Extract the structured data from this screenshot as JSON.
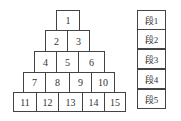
{
  "pyramid": {
    "rows": [
      [
        "1"
      ],
      [
        "2",
        "3"
      ],
      [
        "4",
        "5",
        "6"
      ],
      [
        "7",
        "8",
        "9",
        "10"
      ],
      [
        "11",
        "12",
        "13",
        "14",
        "15"
      ]
    ]
  },
  "segments": {
    "labels": [
      "段1",
      "段2",
      "段3",
      "段4",
      "段5"
    ]
  }
}
